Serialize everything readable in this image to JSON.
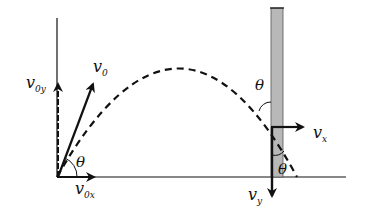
{
  "diagram": {
    "type": "projectile-motion-against-wall",
    "labels": {
      "v0": {
        "main": "v",
        "sub": "0"
      },
      "v0y": {
        "main": "v",
        "sub": "0y"
      },
      "v0x": {
        "main": "v",
        "sub": "0x"
      },
      "vx": {
        "main": "v",
        "sub": "x"
      },
      "vy": {
        "main": "v",
        "sub": "y"
      },
      "theta_launch": "θ",
      "theta_wall_upper": "θ",
      "theta_wall_lower": "θ"
    },
    "colors": {
      "stroke": "#111111",
      "wall_fill": "#b8b8b8",
      "background": "#ffffff"
    }
  }
}
